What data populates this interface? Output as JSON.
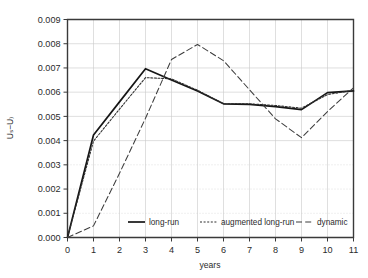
{
  "chart_data": {
    "type": "line",
    "title": "",
    "xlabel": "years",
    "ylabel": "Uₛ−U₎",
    "x": [
      0,
      1,
      2,
      3,
      4,
      5,
      6,
      7,
      8,
      9,
      10,
      11
    ],
    "xlim": [
      0,
      11
    ],
    "ylim": [
      0.0,
      0.009
    ],
    "xticks": [
      "0",
      "1",
      "2",
      "3",
      "4",
      "5",
      "6",
      "7",
      "8",
      "9",
      "10",
      "11"
    ],
    "yticks": [
      "0.000",
      "0.001",
      "0.002",
      "0.003",
      "0.004",
      "0.005",
      "0.006",
      "0.007",
      "0.008",
      "0.009"
    ],
    "ytick_values": [
      0.0,
      0.001,
      0.002,
      0.003,
      0.004,
      0.005,
      0.006,
      0.007,
      0.008,
      0.009
    ],
    "grid": true,
    "legend_position": "bottom-inside",
    "series": [
      {
        "name": "long-run",
        "style": "solid",
        "color": "#161616",
        "values": [
          0.0,
          0.00423,
          0.0056,
          0.00697,
          0.0065,
          0.00605,
          0.00552,
          0.0055,
          0.0054,
          0.00528,
          0.00598,
          0.00605
        ]
      },
      {
        "name": "augmented long-run",
        "style": "dotted",
        "color": "#2e2e2e",
        "values": [
          0.0,
          0.00398,
          0.0053,
          0.0066,
          0.00655,
          0.00608,
          0.00552,
          0.00552,
          0.00545,
          0.00534,
          0.0059,
          0.00608
        ]
      },
      {
        "name": "dynamic",
        "style": "dashed",
        "color": "#3d3d3d",
        "values": [
          0.0,
          0.00048,
          0.00265,
          0.00492,
          0.00735,
          0.00797,
          0.0073,
          0.0061,
          0.0049,
          0.00412,
          0.0052,
          0.00618
        ]
      }
    ]
  },
  "legend": {
    "items": [
      {
        "label": "long-run"
      },
      {
        "label": "augmented long-run"
      },
      {
        "label": "dynamic"
      }
    ]
  }
}
